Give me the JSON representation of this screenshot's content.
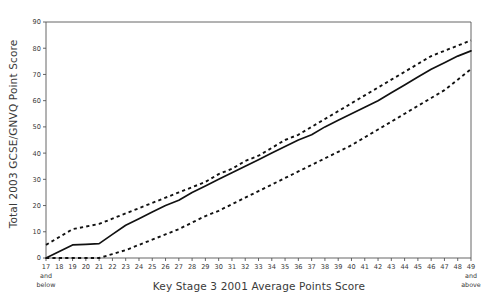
{
  "chart_data": {
    "type": "line",
    "title": "",
    "xlabel": "Key Stage 3 2001 Average Points Score",
    "ylabel": "Total 2003 GCSE/GNVQ Point Score",
    "xlim": [
      17,
      49
    ],
    "ylim": [
      0,
      90
    ],
    "yticks": [
      0,
      10,
      20,
      30,
      40,
      50,
      60,
      70,
      80,
      90
    ],
    "xticks": [
      17,
      18,
      19,
      20,
      21,
      22,
      23,
      24,
      25,
      26,
      27,
      28,
      29,
      30,
      31,
      32,
      33,
      34,
      35,
      36,
      37,
      38,
      39,
      40,
      41,
      42,
      43,
      44,
      45,
      46,
      47,
      48,
      49
    ],
    "xtick_first_suffix": "and below",
    "xtick_last_suffix": "and above",
    "grid": false,
    "legend": "none",
    "x": [
      17,
      18,
      19,
      20,
      21,
      22,
      23,
      24,
      25,
      26,
      27,
      28,
      29,
      30,
      31,
      32,
      33,
      34,
      35,
      36,
      37,
      38,
      39,
      40,
      41,
      42,
      43,
      44,
      45,
      46,
      47,
      48,
      49
    ],
    "series": [
      {
        "name": "Upper confidence limit",
        "style": "dashed",
        "color": "#111111",
        "values": [
          5,
          8,
          11,
          12,
          13,
          15,
          17,
          19,
          21,
          23,
          25,
          27,
          29,
          32,
          34,
          37,
          39,
          42,
          45,
          47,
          50,
          53,
          56,
          59,
          62,
          65,
          68,
          71,
          74,
          77,
          79,
          81,
          83
        ]
      },
      {
        "name": "Median predicted score",
        "style": "solid",
        "color": "#111111",
        "values": [
          0,
          2.5,
          5,
          5.2,
          5.5,
          9,
          12.5,
          15,
          17.5,
          20,
          22,
          25,
          27.5,
          30,
          32.5,
          35,
          37.5,
          40,
          42.5,
          45,
          47,
          50,
          52.5,
          55,
          57.5,
          60,
          63,
          66,
          69,
          72,
          74.5,
          77,
          79
        ]
      },
      {
        "name": "Lower confidence limit",
        "style": "dashed",
        "color": "#111111",
        "values": [
          0,
          0,
          0,
          0,
          0,
          1.5,
          3,
          5,
          7,
          9,
          11,
          13.5,
          16,
          18,
          20.5,
          23,
          25.5,
          28,
          30.5,
          33,
          35.5,
          38,
          40.5,
          43,
          46,
          49,
          52,
          55,
          58,
          61,
          64,
          68,
          72
        ]
      }
    ]
  },
  "axis_frame": {
    "plot_left_px": 46,
    "plot_right_px": 471,
    "plot_top_px": 22,
    "plot_bottom_px": 258,
    "border_color": "#555555"
  }
}
